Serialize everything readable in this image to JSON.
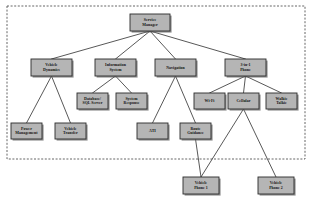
{
  "diagram": {
    "type": "tree-hierarchy",
    "background_color": "#ffffff",
    "node_fill_color": "#b5b5b5",
    "node_border_color": "#2b2b2b",
    "edge_color": "#3a3a3a",
    "boundary": {
      "style": "dashed",
      "color": "#555555",
      "x": 7,
      "y": 6,
      "width": 298,
      "height": 153
    },
    "nodes": [
      {
        "id": "service-manager",
        "label": "Service Manager",
        "lines": [
          "Service",
          "Manager"
        ],
        "level": 0,
        "x": 130,
        "y": 14,
        "w": 40,
        "h": 17
      },
      {
        "id": "vehicle-dynamics",
        "label": "Vehicle Dynamics",
        "lines": [
          "Vehicle",
          "Dynamics"
        ],
        "level": 1,
        "x": 31,
        "y": 59,
        "w": 41,
        "h": 17
      },
      {
        "id": "information-system",
        "label": "Information System",
        "lines": [
          "Information",
          "System"
        ],
        "level": 1,
        "x": 95,
        "y": 59,
        "w": 41,
        "h": 17
      },
      {
        "id": "navigation",
        "label": "Navigation",
        "lines": [
          "Navigation"
        ],
        "level": 1,
        "x": 155,
        "y": 59,
        "w": 41,
        "h": 17
      },
      {
        "id": "three-in-one-phone",
        "label": "3-in-1 Phone",
        "lines": [
          "3-in-1",
          "Phone"
        ],
        "level": 1,
        "x": 225,
        "y": 59,
        "w": 41,
        "h": 17
      },
      {
        "id": "database-sql-server",
        "label": "Database/ SQL Server",
        "lines": [
          "Database/",
          "SQL Server"
        ],
        "level": 2,
        "x": 77,
        "y": 93,
        "w": 31,
        "h": 16
      },
      {
        "id": "system-response",
        "label": "System Response",
        "lines": [
          "System",
          "Response"
        ],
        "level": 2,
        "x": 116,
        "y": 93,
        "w": 31,
        "h": 16
      },
      {
        "id": "wifi",
        "label": "Wi-Fi",
        "lines": [
          "Wi-Fi"
        ],
        "level": 2,
        "x": 194,
        "y": 93,
        "w": 31,
        "h": 16
      },
      {
        "id": "cellular",
        "label": "Cellular",
        "lines": [
          "Cellular"
        ],
        "level": 2,
        "x": 228,
        "y": 93,
        "w": 31,
        "h": 16
      },
      {
        "id": "walkie-talkie",
        "label": "Walkie Talkie",
        "lines": [
          "Walkie",
          "Talkie"
        ],
        "level": 2,
        "x": 266,
        "y": 93,
        "w": 31,
        "h": 16
      },
      {
        "id": "power-management",
        "label": "Power Management",
        "lines": [
          "Power",
          "Management"
        ],
        "level": 3,
        "x": 11,
        "y": 123,
        "w": 31,
        "h": 16
      },
      {
        "id": "vehicle-transfer",
        "label": "Vehicle Transfer",
        "lines": [
          "Vehicle",
          "Transfer"
        ],
        "level": 3,
        "x": 55,
        "y": 123,
        "w": 31,
        "h": 16
      },
      {
        "id": "ati",
        "label": "ATI",
        "lines": [
          "ATI"
        ],
        "level": 3,
        "x": 137,
        "y": 123,
        "w": 31,
        "h": 16
      },
      {
        "id": "route-guidance",
        "label": "Route Guidance",
        "lines": [
          "Route",
          "Guidance"
        ],
        "level": 3,
        "x": 180,
        "y": 123,
        "w": 31,
        "h": 16
      },
      {
        "id": "vehicle-phone-1",
        "label": "Vehicle Phone 1",
        "lines": [
          "Vehicle",
          "Phone 1"
        ],
        "level": 4,
        "x": 183,
        "y": 177,
        "w": 36,
        "h": 17
      },
      {
        "id": "vehicle-phone-2",
        "label": "Vehicle Phone 2",
        "lines": [
          "Vehicle",
          "Phone 2"
        ],
        "level": 4,
        "x": 258,
        "y": 177,
        "w": 36,
        "h": 17
      }
    ],
    "edges": [
      {
        "from": "service-manager",
        "to": "vehicle-dynamics"
      },
      {
        "from": "service-manager",
        "to": "information-system"
      },
      {
        "from": "service-manager",
        "to": "navigation"
      },
      {
        "from": "service-manager",
        "to": "three-in-one-phone"
      },
      {
        "from": "vehicle-dynamics",
        "to": "power-management"
      },
      {
        "from": "vehicle-dynamics",
        "to": "vehicle-transfer"
      },
      {
        "from": "information-system",
        "to": "database-sql-server"
      },
      {
        "from": "information-system",
        "to": "system-response"
      },
      {
        "from": "navigation",
        "to": "ati"
      },
      {
        "from": "navigation",
        "to": "route-guidance"
      },
      {
        "from": "three-in-one-phone",
        "to": "wifi"
      },
      {
        "from": "three-in-one-phone",
        "to": "cellular"
      },
      {
        "from": "three-in-one-phone",
        "to": "walkie-talkie"
      },
      {
        "from": "route-guidance",
        "to": "vehicle-phone-1"
      },
      {
        "from": "cellular",
        "to": "vehicle-phone-1"
      },
      {
        "from": "cellular",
        "to": "vehicle-phone-2"
      }
    ]
  }
}
